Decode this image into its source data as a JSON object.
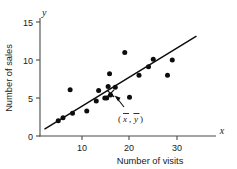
{
  "chart_data": {
    "type": "scatter",
    "title": "",
    "xlabel": "Number of visits",
    "ylabel": "Number of sales",
    "x_axis_symbol": "x",
    "y_axis_symbol": "y",
    "xlim": [
      0,
      36
    ],
    "ylim": [
      0,
      16.5
    ],
    "x_ticks": [
      10,
      20,
      30
    ],
    "y_ticks": [
      0,
      5,
      10,
      15
    ],
    "grid": false,
    "legend": null,
    "points": [
      {
        "x": 5,
        "y": 2
      },
      {
        "x": 6,
        "y": 2.4
      },
      {
        "x": 7.5,
        "y": 6.1
      },
      {
        "x": 8,
        "y": 3
      },
      {
        "x": 11,
        "y": 3.3
      },
      {
        "x": 13,
        "y": 4.6
      },
      {
        "x": 13.5,
        "y": 6
      },
      {
        "x": 14.8,
        "y": 5
      },
      {
        "x": 15.2,
        "y": 5
      },
      {
        "x": 15.5,
        "y": 6.5
      },
      {
        "x": 15.8,
        "y": 8.2
      },
      {
        "x": 16,
        "y": 5.4
      },
      {
        "x": 17,
        "y": 6.4
      },
      {
        "x": 19,
        "y": 11
      },
      {
        "x": 20,
        "y": 5.1
      },
      {
        "x": 22,
        "y": 8
      },
      {
        "x": 24,
        "y": 9.1
      },
      {
        "x": 25,
        "y": 10.1
      },
      {
        "x": 28,
        "y": 8
      },
      {
        "x": 29,
        "y": 10
      }
    ],
    "trend_line": {
      "x_start": 2.2,
      "y_start": 0.95,
      "x_end": 34,
      "y_end": 13.1,
      "style": "solid"
    },
    "mean_marker": {
      "x": 16,
      "y": 5.6,
      "symbol": "x-cross",
      "label_x": "x",
      "label_y": "y",
      "label_open": "(",
      "label_comma": ",",
      "label_close": ")"
    }
  },
  "colors": {
    "point": "#0d0d0d",
    "line": "#0d0d0d",
    "axis": "#4a4a4a",
    "text": "#1a1a1a",
    "background": "#ffffff"
  }
}
